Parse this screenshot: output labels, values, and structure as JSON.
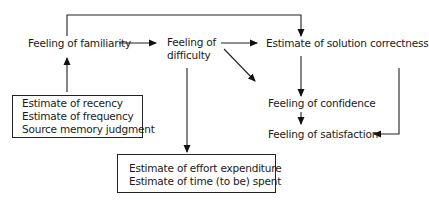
{
  "nodes": {
    "familiarity": "Feeling of familiarity",
    "difficulty_1": "Feeling of",
    "difficulty_2": "difficulty",
    "solution_correctness": "Estimate of solution correctness",
    "confidence": "Feeling of confidence",
    "satisfaction": "Feeling of satisfaction"
  },
  "memory_box": {
    "lines": [
      "Estimate of recency",
      "Estimate of frequency",
      "Source memory judgment"
    ]
  },
  "effort_box": {
    "lines": [
      "Estimate of effort expenditure",
      "Estimate of time (to be) spent"
    ]
  },
  "edges": [
    {
      "from": "memory_box",
      "to": "familiarity"
    },
    {
      "from": "familiarity",
      "to": "difficulty"
    },
    {
      "from": "familiarity",
      "to": "solution_correctness",
      "route": "over-top"
    },
    {
      "from": "difficulty",
      "to": "solution_correctness"
    },
    {
      "from": "difficulty",
      "to": "confidence",
      "style": "diagonal"
    },
    {
      "from": "difficulty",
      "to": "effort_box"
    },
    {
      "from": "solution_correctness",
      "to": "confidence"
    },
    {
      "from": "confidence",
      "to": "satisfaction"
    },
    {
      "from": "solution_correctness",
      "to": "satisfaction",
      "route": "right-bracket"
    }
  ]
}
